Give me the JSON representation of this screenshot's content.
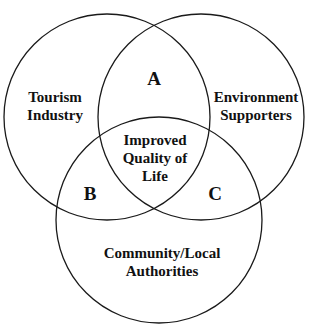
{
  "diagram": {
    "type": "venn",
    "sets": [
      {
        "id": "tourism",
        "label_lines": [
          "Tourism",
          "Industry"
        ],
        "circle": {
          "cx": 107,
          "cy": 117,
          "r": 103
        }
      },
      {
        "id": "environment",
        "label_lines": [
          "Environment",
          "Supporters"
        ],
        "circle": {
          "cx": 201,
          "cy": 117,
          "r": 103
        }
      },
      {
        "id": "community",
        "label_lines": [
          "Community/Local",
          "Authorities"
        ],
        "circle": {
          "cx": 159,
          "cy": 220,
          "r": 103
        }
      }
    ],
    "regions": {
      "a": {
        "label": "A",
        "between": [
          "Tourism Industry",
          "Environment Supporters"
        ]
      },
      "b": {
        "label": "B",
        "between": [
          "Tourism Industry",
          "Community/Local Authorities"
        ]
      },
      "c": {
        "label": "C",
        "between": [
          "Environment Supporters",
          "Community/Local Authorities"
        ]
      },
      "center": {
        "label_lines": [
          "Improved",
          "Quality of",
          "Life"
        ]
      }
    },
    "stroke_color": "#1a1a1a",
    "text_color": "#111111",
    "background": "#ffffff"
  }
}
